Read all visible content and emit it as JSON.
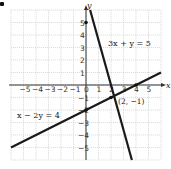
{
  "chart_data": {
    "type": "line",
    "title": "",
    "xlabel": "x",
    "ylabel": "y",
    "xlim": [
      -6,
      6
    ],
    "ylim": [
      -6,
      6
    ],
    "grid": true,
    "x_tick_labels": [
      "-5",
      "-4",
      "-3",
      "-2",
      "-1",
      "0",
      "1",
      "2",
      "3",
      "4",
      "5"
    ],
    "y_tick_labels": [
      "5",
      "4",
      "3",
      "2",
      "1",
      "-1",
      "-2",
      "-3",
      "-4",
      "-5"
    ],
    "series": [
      {
        "name": "3x + y = 5",
        "equation": "y = -3x + 5",
        "points": [
          [
            0.33,
            6
          ],
          [
            3.67,
            -6
          ]
        ]
      },
      {
        "name": "x - 2y = 4",
        "equation": "y = 0.5x - 2",
        "points": [
          [
            -6,
            -5
          ],
          [
            6,
            1
          ]
        ]
      }
    ],
    "annotations": [
      {
        "text": "(2, −1)",
        "x": 2,
        "y": -1,
        "type": "intersection"
      },
      {
        "text": "3x + y = 5",
        "anchor": [
          1.6,
          3.2
        ]
      },
      {
        "text": "x − 2y = 4",
        "anchor": [
          -5.5,
          -2.3
        ]
      }
    ],
    "marked_points": [
      [
        0,
        5
      ],
      [
        0,
        -2
      ],
      [
        4,
        0
      ],
      [
        2,
        -1
      ]
    ]
  },
  "labels": {
    "x_axis": "x",
    "y_axis": "y",
    "eq1": "3x + y = 5",
    "eq2": "x − 2y = 4",
    "intersection": "(2, −1)"
  }
}
